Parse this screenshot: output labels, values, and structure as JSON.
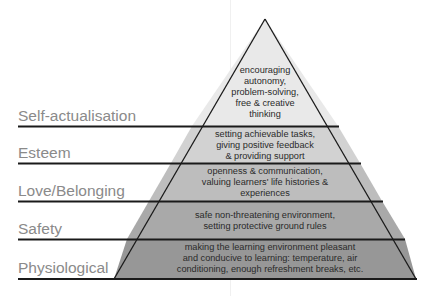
{
  "diagram": {
    "type": "pyramid",
    "colors": {
      "tier1_top": "#e9e9e9",
      "tier2": "#d2d2d2",
      "tier3": "#bdbdbd",
      "tier4": "#a9a9a9",
      "tier5_bottom": "#979797",
      "line": "#1a1a1a",
      "label": "#8a8a8a"
    },
    "levels": [
      {
        "label": "Self-actualisation",
        "description": "encouraging autonomy, problem-solving, free & creative thinking",
        "lines": [
          "encouraging",
          "autonomy,",
          "problem-solving,",
          "free & creative",
          "thinking"
        ]
      },
      {
        "label": "Esteem",
        "description": "setting achievable tasks, giving positive feedback & providing support",
        "lines": [
          "setting achievable tasks,",
          "giving positive feedback",
          "& providing support"
        ]
      },
      {
        "label": "Love/Belonging",
        "description": "openness & communication, valuing learners' life histories & experiences",
        "lines": [
          "openness & communication,",
          "valuing learners' life histories &",
          "experiences"
        ]
      },
      {
        "label": "Safety",
        "description": "safe non-threatening environment, setting protective ground rules",
        "lines": [
          "safe non-threatening environment,",
          "setting protective ground rules"
        ]
      },
      {
        "label": "Physiological",
        "description": "making the learning environment pleasant and conducive to learning: temperature, air conditioning, enough refreshment breaks, etc.",
        "lines": [
          "making the learning environment pleasant",
          "and conducive to learning: temperature, air",
          "conditioning, enough refreshment breaks, etc."
        ]
      }
    ]
  }
}
